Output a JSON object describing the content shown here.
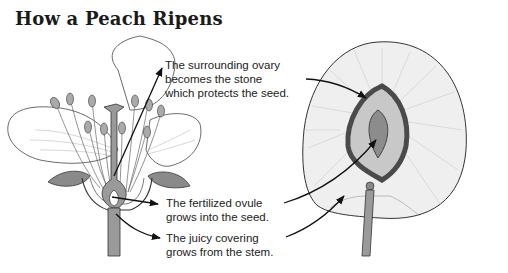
{
  "title": "How a Peach Ripens",
  "labels": {
    "ovary": {
      "lines": [
        "The surrounding ovary",
        "becomes the stone",
        "which protects the seed."
      ]
    },
    "ovule": {
      "lines": [
        "The fertilized ovule",
        "grows into the seed."
      ]
    },
    "covering": {
      "lines": [
        "The juicy covering",
        "grows from the stem."
      ]
    }
  },
  "illustrations": {
    "left": "peach-blossom-cross-section",
    "right": "peach-fruit-cross-section"
  },
  "colors": {
    "ink": "#222222",
    "petal_fill": "#ffffff",
    "sepal_fill": "#8a8a8a",
    "stem_fill": "#9a9a9a",
    "flesh_fill": "#efefef",
    "stone_outer": "#555555",
    "stone_inner": "#c8c8c8",
    "seed_fill": "#8c8c8c"
  }
}
